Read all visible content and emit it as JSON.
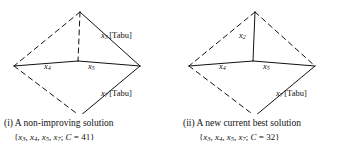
{
  "figure": {
    "panels": [
      {
        "id": "non-improving-solution",
        "diagram": {
          "node_labels": [
            {
              "name": "x3-tabu-label",
              "var": "x",
              "sub": "3",
              "tabu": "[Tabu]"
            },
            {
              "name": "x4-label",
              "var": "x",
              "sub": "4",
              "tabu": ""
            },
            {
              "name": "x5-label",
              "var": "x",
              "sub": "5",
              "tabu": ""
            },
            {
              "name": "x7-tabu-label",
              "var": "x",
              "sub": "7",
              "tabu": "[Tabu]"
            }
          ],
          "edges": [
            {
              "name": "edge-top-left",
              "style": "dashed"
            },
            {
              "name": "edge-top-right",
              "style": "solid"
            },
            {
              "name": "edge-bottom-left",
              "style": "dashed"
            },
            {
              "name": "edge-bottom-right",
              "style": "solid"
            },
            {
              "name": "edge-center-vertical",
              "style": "dashed"
            },
            {
              "name": "edge-center-left",
              "style": "solid"
            },
            {
              "name": "edge-center-right",
              "style": "solid"
            }
          ]
        },
        "caption": {
          "label": "(i)",
          "text": "A non-improving solution",
          "set": {
            "open": "{",
            "items": [
              {
                "var": "x",
                "sub": "3"
              },
              {
                "var": "x",
                "sub": "4"
              },
              {
                "var": "x",
                "sub": "5"
              },
              {
                "var": "x",
                "sub": "7"
              }
            ],
            "separator": ", ",
            "terminator": ";",
            "cost_symbol": "C",
            "cost_equals": " = ",
            "cost_value": "41",
            "close": "}"
          }
        }
      },
      {
        "id": "new-current-best-solution",
        "diagram": {
          "node_labels": [
            {
              "name": "x2-label",
              "var": "x",
              "sub": "2",
              "tabu": ""
            },
            {
              "name": "x4-label",
              "var": "x",
              "sub": "4",
              "tabu": ""
            },
            {
              "name": "x5-label",
              "var": "x",
              "sub": "5",
              "tabu": ""
            },
            {
              "name": "x7-tabu-label",
              "var": "x",
              "sub": "7",
              "tabu": "[Tabu]"
            }
          ],
          "edges": [
            {
              "name": "edge-top-left",
              "style": "dashed"
            },
            {
              "name": "edge-top-right",
              "style": "dashed"
            },
            {
              "name": "edge-bottom-left",
              "style": "dashed"
            },
            {
              "name": "edge-bottom-right",
              "style": "solid"
            },
            {
              "name": "edge-center-vertical",
              "style": "solid"
            },
            {
              "name": "edge-center-left",
              "style": "solid"
            },
            {
              "name": "edge-center-right",
              "style": "solid"
            }
          ]
        },
        "caption": {
          "label": "(ii)",
          "text": "A new current best solution",
          "set": {
            "open": "{",
            "items": [
              {
                "var": "x",
                "sub": "3"
              },
              {
                "var": "x",
                "sub": "4"
              },
              {
                "var": "x",
                "sub": "5"
              },
              {
                "var": "x",
                "sub": "7"
              }
            ],
            "separator": ", ",
            "terminator": ";",
            "cost_symbol": "C",
            "cost_equals": " = ",
            "cost_value": "32",
            "close": "}"
          }
        }
      }
    ],
    "colors": {
      "ink": "#111111",
      "background": "#ffffff"
    }
  }
}
